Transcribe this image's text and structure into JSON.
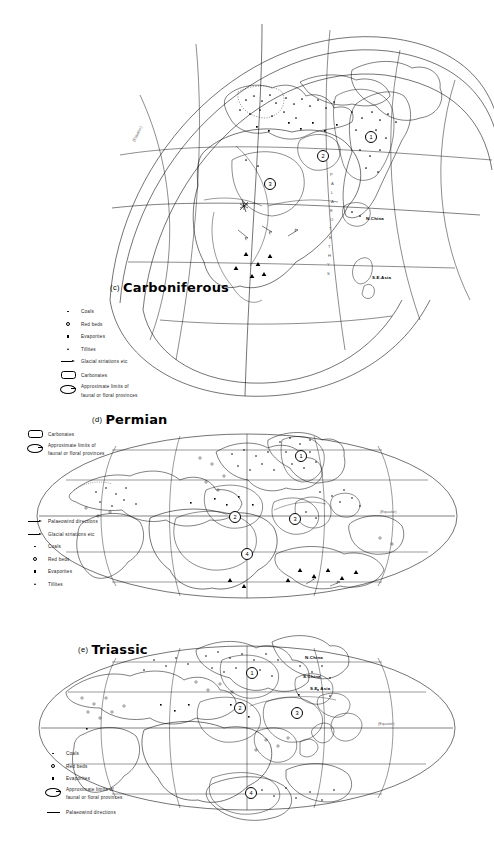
{
  "figure": {
    "background": "#ffffff",
    "line_color": "#000000",
    "type": "palaeogeographic reconstruction maps"
  },
  "panels": [
    {
      "id": "carboniferous",
      "letter": "(c)",
      "name": "Carboniferous",
      "projection": "oblique polar",
      "equator_label": "(Equator)",
      "ocean_label": "PALAEOTETHYS",
      "map_labels": [
        {
          "text": "N.China",
          "x": 366,
          "y": 218
        },
        {
          "text": "S.E.Asia",
          "x": 372,
          "y": 277
        }
      ],
      "provinces": [
        {
          "number": "1",
          "x": 370,
          "y": 136
        },
        {
          "number": "2",
          "x": 322,
          "y": 155
        },
        {
          "number": "3",
          "x": 269,
          "y": 183
        }
      ],
      "legend": [
        {
          "symbol": "dot",
          "label": "Coals"
        },
        {
          "symbol": "open-circle",
          "label": "Red beds"
        },
        {
          "symbol": "filled-square",
          "label": "Evaporites"
        },
        {
          "symbol": "triangle",
          "label": "Tillites"
        },
        {
          "symbol": "arrow",
          "label": "Glacial striations etc"
        },
        {
          "symbol": "rounded-rect",
          "label": "Carbonates"
        },
        {
          "symbol": "province-loop",
          "label": "Approximate limits of",
          "label2": "faunal or floral provinces"
        }
      ]
    },
    {
      "id": "permian",
      "letter": "(d)",
      "name": "Permian",
      "projection": "elliptical (Mollweide)",
      "equator_label": "(Equator)",
      "provinces": [
        {
          "number": "1",
          "x": 300,
          "y": 455
        },
        {
          "number": "2",
          "x": 244,
          "y": 516
        },
        {
          "number": "3",
          "x": 297,
          "y": 518
        },
        {
          "number": "4",
          "x": 250,
          "y": 553
        }
      ],
      "legend_top": [
        {
          "symbol": "rounded-rect",
          "label": "Carbonates"
        },
        {
          "symbol": "province-loop",
          "label": "Approximate limits of",
          "label2": "faunal or floral provinces"
        }
      ],
      "legend_bottom": [
        {
          "symbol": "line-arrow",
          "label": "Palaeowind directions"
        },
        {
          "symbol": "arrow",
          "label": "Glacial striations etc"
        },
        {
          "symbol": "dot",
          "label": "Coals"
        },
        {
          "symbol": "open-circle",
          "label": "Red beds"
        },
        {
          "symbol": "filled-square",
          "label": "Evaporites"
        },
        {
          "symbol": "triangle",
          "label": "Tillites"
        }
      ]
    },
    {
      "id": "triassic",
      "letter": "(e)",
      "name": "Triassic",
      "projection": "elliptical (Mollweide)",
      "equator_label": "(Equator)",
      "ocean_label": "NEOTETHYS",
      "map_labels": [
        {
          "text": "N.China",
          "x": 305,
          "y": 656
        },
        {
          "text": "S.China",
          "x": 303,
          "y": 675
        },
        {
          "text": "S.E. Asia",
          "x": 310,
          "y": 686
        }
      ],
      "provinces": [
        {
          "number": "1",
          "x": 251,
          "y": 672
        },
        {
          "number": "2",
          "x": 239,
          "y": 707
        },
        {
          "number": "3",
          "x": 296,
          "y": 712
        },
        {
          "number": "4",
          "x": 250,
          "y": 792
        }
      ],
      "legend": [
        {
          "symbol": "dot",
          "label": "Coals"
        },
        {
          "symbol": "open-circle",
          "label": "Red beds"
        },
        {
          "symbol": "filled-square",
          "label": "Evaporites"
        },
        {
          "symbol": "province-loop",
          "label": "Approximate limits of",
          "label2": "faunal or floral provinces"
        },
        {
          "symbol": "line-arrow",
          "label": "Palaeowind directions"
        }
      ]
    }
  ]
}
